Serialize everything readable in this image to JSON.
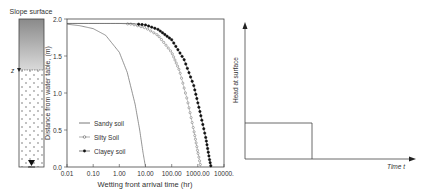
{
  "column": {
    "top_label": "Slope surface",
    "z_label": "z",
    "water_table_symbol": "water-table-triangle"
  },
  "chart_data": [
    {
      "type": "line",
      "title": "",
      "xlabel": "Wetting front arrival time (hr)",
      "ylabel": "Distance from water table, (m)",
      "xscale": "log",
      "xlim": [
        0.01,
        10000
      ],
      "ylim": [
        0.0,
        2.0
      ],
      "x_ticks": [
        "0.01",
        "0.10",
        "1.00",
        "10.00",
        "100.00",
        "1000.00",
        "10000."
      ],
      "y_ticks": [
        "0.0",
        "0.5",
        "1.0",
        "1.5",
        "2.0"
      ],
      "grid": false,
      "legend_position": "lower left",
      "series": [
        {
          "name": "Sandy soil",
          "marker": "none",
          "points": [
            [
              0.01,
              1.93
            ],
            [
              0.03,
              1.91
            ],
            [
              0.1,
              1.87
            ],
            [
              0.3,
              1.78
            ],
            [
              1.0,
              1.55
            ],
            [
              2.0,
              1.28
            ],
            [
              4.0,
              0.85
            ],
            [
              6.0,
              0.5
            ],
            [
              8.0,
              0.2
            ],
            [
              10.0,
              0.0
            ]
          ]
        },
        {
          "name": "Silty Soil",
          "marker": "open-circle",
          "points": [
            [
              0.01,
              1.94
            ],
            [
              1.0,
              1.94
            ],
            [
              3.0,
              1.93
            ],
            [
              10.0,
              1.88
            ],
            [
              30.0,
              1.78
            ],
            [
              100.0,
              1.55
            ],
            [
              200.0,
              1.3
            ],
            [
              400.0,
              0.9
            ],
            [
              700.0,
              0.5
            ],
            [
              1000.0,
              0.2
            ],
            [
              1300.0,
              0.0
            ]
          ]
        },
        {
          "name": "Clayey soil",
          "marker": "filled-circle",
          "points": [
            [
              0.01,
              1.94
            ],
            [
              3.0,
              1.94
            ],
            [
              10.0,
              1.92
            ],
            [
              30.0,
              1.86
            ],
            [
              100.0,
              1.72
            ],
            [
              300.0,
              1.45
            ],
            [
              700.0,
              1.1
            ],
            [
              1200.0,
              0.75
            ],
            [
              2000.0,
              0.4
            ],
            [
              2800.0,
              0.1
            ],
            [
              3200.0,
              0.0
            ]
          ]
        }
      ]
    },
    {
      "type": "line",
      "title": "",
      "xlabel": "Time t",
      "ylabel": "Head at surface",
      "grid": false,
      "description": "Rectangular pulse: constant head from t=0 until a cutoff, then zero",
      "series": [
        {
          "name": "Head at surface",
          "points": [
            [
              0,
              0
            ],
            [
              0,
              0.27
            ],
            [
              0.4,
              0.27
            ],
            [
              0.4,
              0
            ],
            [
              1.0,
              0
            ]
          ]
        }
      ]
    }
  ]
}
